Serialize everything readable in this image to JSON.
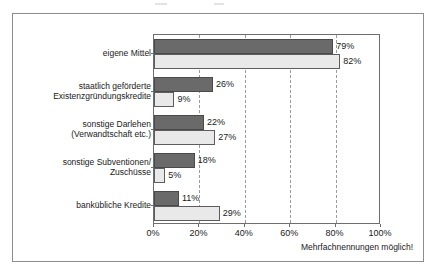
{
  "figure": {
    "footnote": "Mehrfachnennungen möglich!"
  },
  "legend": {
    "position": "inside-bottom-right",
    "items": [
      {
        "label": "2004",
        "swatch": "dark-gray-filled-square-icon",
        "color": "#6a6a6a"
      },
      {
        "label": "1997",
        "swatch": "white-outlined-square-icon",
        "color": "#ffffff"
      }
    ]
  },
  "chart_data": {
    "type": "bar",
    "orientation": "horizontal",
    "title": "",
    "subtitle": "",
    "xlabel": "",
    "ylabel": "",
    "xlim": [
      0,
      100
    ],
    "xtick_labels": [
      "0%",
      "20%",
      "40%",
      "60%",
      "80%",
      "100%"
    ],
    "xticks": [
      0,
      20,
      40,
      60,
      80,
      100
    ],
    "grid": "vertical-dashed",
    "value_suffix": "%",
    "categories": [
      "eigene Mittel",
      "staatlich geförderte Existenzgründungskredite",
      "sonstige Darlehen (Verwandtschaft etc.)",
      "sonstige Subventionen/ Zuschüsse",
      "bankübliche Kredite"
    ],
    "category_lines": [
      [
        "eigene Mittel"
      ],
      [
        "staatlich geförderte",
        "Existenzgründungskredite"
      ],
      [
        "sonstige Darlehen",
        "(Verwandtschaft etc.)"
      ],
      [
        "sonstige Subventionen/",
        "Zuschüsse"
      ],
      [
        "bankübliche Kredite"
      ]
    ],
    "series": [
      {
        "name": "2004",
        "color": "#6a6a6a",
        "values": [
          79,
          26,
          22,
          18,
          11
        ],
        "labels": [
          "79%",
          "26%",
          "22%",
          "18%",
          "11%"
        ]
      },
      {
        "name": "1997",
        "color": "#e9e9e9",
        "values": [
          82,
          9,
          27,
          5,
          29
        ],
        "labels": [
          "82%",
          "9%",
          "27%",
          "5%",
          "29%"
        ]
      }
    ],
    "annotations": [
      "Mehrfachnennungen möglich!"
    ]
  }
}
